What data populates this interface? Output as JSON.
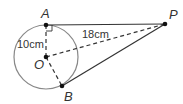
{
  "diagram": {
    "points": {
      "A": {
        "label": "A",
        "x": 46,
        "y": 25
      },
      "O": {
        "label": "O",
        "x": 46,
        "y": 57
      },
      "B": {
        "label": "B",
        "x": 62,
        "y": 86
      },
      "P": {
        "label": "P",
        "x": 165,
        "y": 24
      }
    },
    "circle": {
      "cx": 46,
      "cy": 57,
      "r": 32
    },
    "measurements": {
      "radius_label": "10cm",
      "op_label": "18cm"
    },
    "segments": [
      {
        "from": "A",
        "to": "P",
        "style": "solid"
      },
      {
        "from": "B",
        "to": "P",
        "style": "solid"
      },
      {
        "from": "O",
        "to": "P",
        "style": "dashed"
      },
      {
        "from": "O",
        "to": "A",
        "style": "dashed"
      },
      {
        "from": "O",
        "to": "B",
        "style": "dashed"
      }
    ],
    "right_angle_at": "A",
    "colors": {
      "stroke": "#333333",
      "circle": "#888888",
      "points": "#111111"
    }
  }
}
